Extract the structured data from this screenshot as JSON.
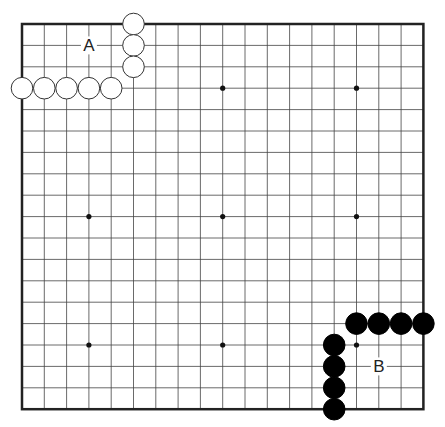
{
  "board": {
    "size": 19,
    "origin": {
      "x": 22,
      "y": 24
    },
    "spacing": {
      "x": 22.3,
      "y": 21.4
    },
    "line_color": "#444444",
    "border_color": "#222222",
    "background": "#ffffff"
  },
  "star_points": [
    [
      3,
      3
    ],
    [
      9,
      3
    ],
    [
      15,
      3
    ],
    [
      3,
      9
    ],
    [
      9,
      9
    ],
    [
      15,
      9
    ],
    [
      3,
      15
    ],
    [
      9,
      15
    ],
    [
      15,
      15
    ]
  ],
  "stones": {
    "white": [
      [
        5,
        0
      ],
      [
        5,
        1
      ],
      [
        5,
        2
      ],
      [
        0,
        3
      ],
      [
        1,
        3
      ],
      [
        2,
        3
      ],
      [
        3,
        3
      ],
      [
        4,
        3
      ]
    ],
    "black": [
      [
        15,
        14
      ],
      [
        16,
        14
      ],
      [
        17,
        14
      ],
      [
        18,
        14
      ],
      [
        14,
        15
      ],
      [
        14,
        16
      ],
      [
        14,
        17
      ],
      [
        14,
        18
      ]
    ]
  },
  "labels": [
    {
      "text": "A",
      "col": 3,
      "row": 1
    },
    {
      "text": "B",
      "col": 16,
      "row": 16
    }
  ]
}
